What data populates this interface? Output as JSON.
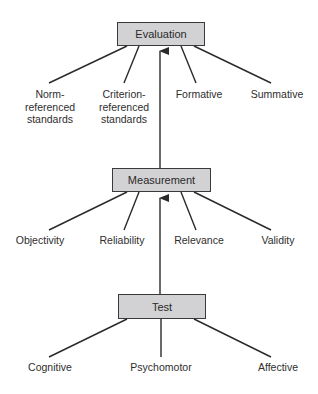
{
  "diagram": {
    "nodes": {
      "evaluation": {
        "label": "Evaluation"
      },
      "measurement": {
        "label": "Measurement"
      },
      "test": {
        "label": "Test"
      }
    },
    "evaluation_children": [
      {
        "line1": "Norm-",
        "line2": "referenced",
        "line3": "standards"
      },
      {
        "line1": "Criterion-",
        "line2": "referenced",
        "line3": "standards"
      },
      {
        "line1": "Formative"
      },
      {
        "line1": "Summative"
      }
    ],
    "measurement_children": [
      {
        "label": "Objectivity"
      },
      {
        "label": "Reliability"
      },
      {
        "label": "Relevance"
      },
      {
        "label": "Validity"
      }
    ],
    "test_children": [
      {
        "label": "Cognitive"
      },
      {
        "label": "Psychomotor"
      },
      {
        "label": "Affective"
      }
    ],
    "arrows": [
      {
        "from": "Test",
        "to": "Measurement"
      },
      {
        "from": "Measurement",
        "to": "Evaluation"
      }
    ],
    "colors": {
      "box_fill": "#d2d2d4",
      "line": "#2a2a2a"
    }
  }
}
